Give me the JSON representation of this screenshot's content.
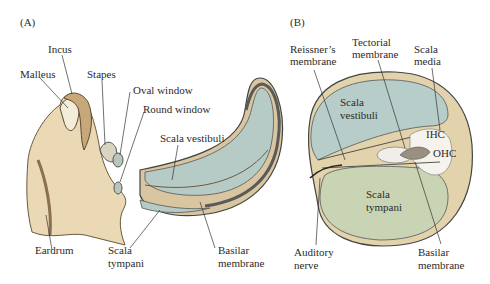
{
  "panels": {
    "a": {
      "label": "(A)",
      "labels": {
        "incus": "Incus",
        "malleus": "Malleus",
        "stapes": "Stapes",
        "oval_window": "Oval window",
        "round_window": "Round window",
        "scala_vestibuli": "Scala vestibuli",
        "eardrum": "Eardrum",
        "scala_tympani_1": "Scala",
        "scala_tympani_2": "tympani",
        "basilar_1": "Basilar",
        "basilar_2": "membrane"
      }
    },
    "b": {
      "label": "(B)",
      "labels": {
        "reissner_1": "Reissner’s",
        "reissner_2": "membrane",
        "tectorial_1": "Tectorial",
        "tectorial_2": "membrane",
        "scala_media_1": "Scala",
        "scala_media_2": "media",
        "scala_vestibuli_1": "Scala",
        "scala_vestibuli_2": "vestibuli",
        "ihc": "IHC",
        "ohc": "OHC",
        "scala_tympani_1": "Scala",
        "scala_tympani_2": "tympani",
        "auditory_1": "Auditory",
        "auditory_2": "nerve",
        "basilar_1": "Basilar",
        "basilar_2": "membrane"
      }
    }
  },
  "colors": {
    "bone": "#e8d7b0",
    "bone_dark": "#b89a6a",
    "fluid_blue": "#b7cdc9",
    "fluid_green": "#c9d3b2",
    "membrane_tan": "#dcc9a0",
    "outline": "#3a3a3a"
  }
}
